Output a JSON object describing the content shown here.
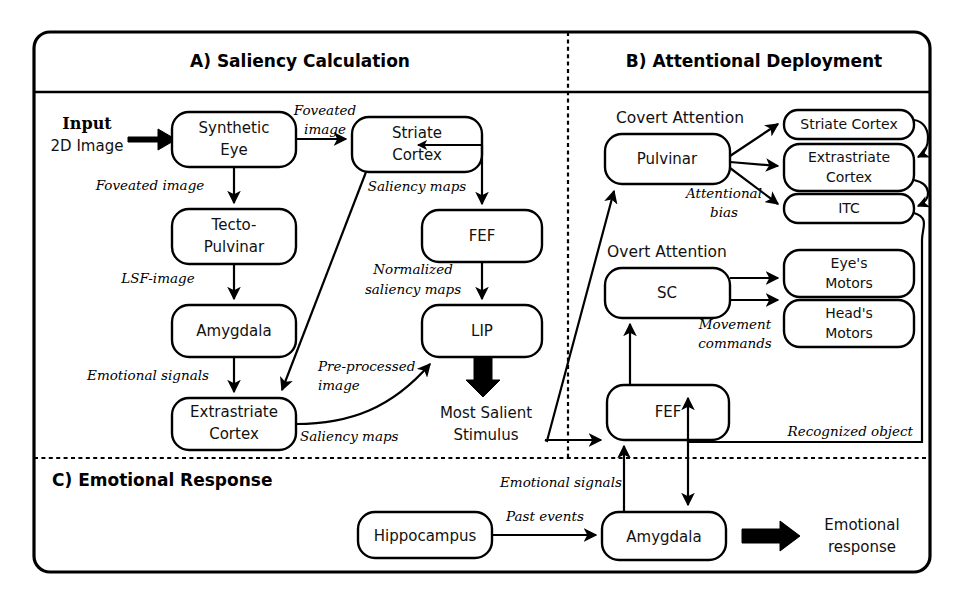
{
  "figure": {
    "panels": [
      {
        "id": "A",
        "title": "A) Saliency Calculation"
      },
      {
        "id": "B",
        "title": "B) Attentional Deployment"
      },
      {
        "id": "C",
        "title": "C) Emotional Response"
      }
    ],
    "group_labels": {
      "covert": "Covert Attention",
      "overt": "Overt Attention"
    },
    "free_text": {
      "input_bold": "Input",
      "input_sub": "2D Image",
      "most_salient_1": "Most Salient",
      "most_salient_2": "Stimulus",
      "emotional_resp_1": "Emotional",
      "emotional_resp_2": "response"
    },
    "nodes": [
      {
        "id": "synthetic_eye",
        "line1": "Synthetic",
        "line2": "Eye"
      },
      {
        "id": "tecto_pulvinar",
        "line1": "Tecto-",
        "line2": "Pulvinar"
      },
      {
        "id": "amygdala_a",
        "line1": "Amygdala",
        "line2": ""
      },
      {
        "id": "extrastriate_a",
        "line1": "Extrastriate",
        "line2": "Cortex"
      },
      {
        "id": "striate_a",
        "line1": "Striate",
        "line2": "Cortex"
      },
      {
        "id": "fef_a",
        "line1": "FEF",
        "line2": ""
      },
      {
        "id": "lip",
        "line1": "LIP",
        "line2": ""
      },
      {
        "id": "pulvinar_b",
        "line1": "Pulvinar",
        "line2": ""
      },
      {
        "id": "striate_b",
        "line1": "Striate Cortex",
        "line2": ""
      },
      {
        "id": "extrastriate_b",
        "line1": "Extrastriate",
        "line2": "Cortex"
      },
      {
        "id": "itc",
        "line1": "ITC",
        "line2": ""
      },
      {
        "id": "sc",
        "line1": "SC",
        "line2": ""
      },
      {
        "id": "eyes_motors",
        "line1": "Eye's",
        "line2": "Motors"
      },
      {
        "id": "heads_motors",
        "line1": "Head's",
        "line2": "Motors"
      },
      {
        "id": "fef_b",
        "line1": "FEF",
        "line2": ""
      },
      {
        "id": "hippocampus",
        "line1": "Hippocampus",
        "line2": ""
      },
      {
        "id": "amygdala_c",
        "line1": "Amygdala",
        "line2": ""
      }
    ],
    "edge_labels": {
      "foveated_image_down": "Foveated image",
      "foveated_image_r1": "Foveated",
      "foveated_image_r2": "image",
      "lsf_image": "LSF-image",
      "emotional_signals_a": "Emotional signals",
      "saliency_maps_striate": "Saliency maps",
      "normalized_1": "Normalized",
      "normalized_2": "saliency maps",
      "pre_processed_1": "Pre-processed",
      "pre_processed_2": "image",
      "saliency_maps_extra": "Saliency maps",
      "attentional_1": "Attentional",
      "attentional_2": "bias",
      "movement_1": "Movement",
      "movement_2": "commands",
      "recognized_object": "Recognized object",
      "emotional_signals_c": "Emotional signals",
      "past_events": "Past events"
    },
    "colors": {
      "stroke": "#000000",
      "background": "#ffffff"
    }
  }
}
